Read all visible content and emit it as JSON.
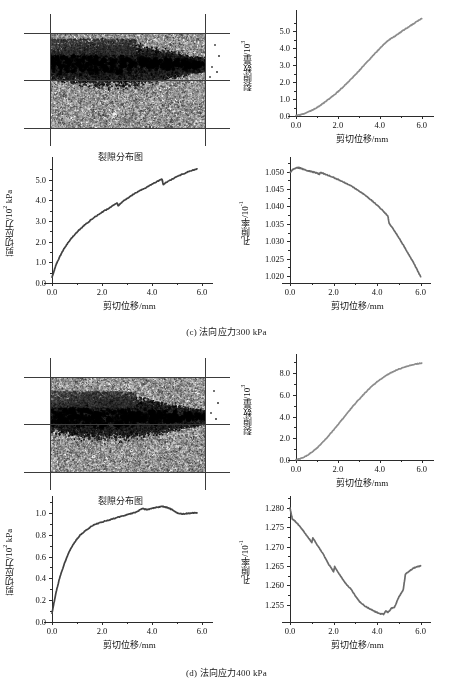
{
  "figure": {
    "panels": [
      {
        "id": "c",
        "caption": "(c) 法向应力300 kPa",
        "crack_image_label": "裂隙分布图"
      },
      {
        "id": "d",
        "caption": "(d) 法向应力400 kPa",
        "crack_image_label": "裂隙分布图"
      }
    ]
  },
  "chart_data": [
    {
      "id": "c-crack-number",
      "type": "line",
      "title": "",
      "xlabel": "剪切位移/mm",
      "ylabel": "裂隙数量/10³",
      "xlim": [
        0.0,
        6.3
      ],
      "ylim": [
        0.0,
        5.9
      ],
      "xticks": [
        0.0,
        2.0,
        4.0,
        6.0
      ],
      "xticklabels": [
        "0.0",
        "2.0",
        "4.0",
        "6.0"
      ],
      "yticks": [
        0.0,
        1.0,
        2.0,
        3.0,
        4.0,
        5.0
      ],
      "yticklabels": [
        "0.0",
        "1.0",
        "2.0",
        "3.0",
        "4.0",
        "5.0"
      ],
      "grid": false,
      "legend": "none",
      "color": "#8c8c8c",
      "x": [
        0.0,
        0.2,
        0.4,
        0.6,
        0.8,
        1.0,
        1.2,
        1.4,
        1.6,
        1.8,
        2.0,
        2.2,
        2.4,
        2.6,
        2.8,
        3.0,
        3.2,
        3.4,
        3.6,
        3.8,
        4.0,
        4.2,
        4.4,
        4.6,
        4.8,
        5.0,
        5.2,
        5.4,
        5.6,
        5.8,
        6.0
      ],
      "y": [
        0.02,
        0.07,
        0.14,
        0.24,
        0.36,
        0.5,
        0.66,
        0.84,
        1.03,
        1.22,
        1.43,
        1.66,
        1.9,
        2.14,
        2.4,
        2.66,
        2.93,
        3.2,
        3.47,
        3.73,
        3.99,
        4.24,
        4.46,
        4.62,
        4.78,
        4.95,
        5.12,
        5.28,
        5.44,
        5.6,
        5.75
      ]
    },
    {
      "id": "c-shear-stress",
      "type": "line",
      "title": "",
      "xlabel": "剪切位移/mm",
      "ylabel": "剪切应力/10² kPa",
      "xlim": [
        0.0,
        6.2
      ],
      "ylim": [
        0.0,
        5.8
      ],
      "xticks": [
        0.0,
        2.0,
        4.0,
        6.0
      ],
      "xticklabels": [
        "0.0",
        "2.0",
        "4.0",
        "6.0"
      ],
      "yticks": [
        0.0,
        1.0,
        2.0,
        3.0,
        4.0,
        5.0
      ],
      "yticklabels": [
        "0.0",
        "1.0",
        "2.0",
        "3.0",
        "4.0",
        "5.0"
      ],
      "grid": false,
      "legend": "none",
      "color": "#414141",
      "x": [
        0.0,
        0.05,
        0.15,
        0.3,
        0.5,
        0.7,
        0.9,
        1.1,
        1.4,
        1.7,
        2.0,
        2.3,
        2.6,
        2.65,
        2.75,
        3.0,
        3.3,
        3.6,
        3.9,
        4.2,
        4.4,
        4.45,
        4.6,
        4.9,
        5.2,
        5.5,
        5.8
      ],
      "y": [
        0.28,
        0.45,
        0.85,
        1.25,
        1.7,
        2.05,
        2.33,
        2.58,
        2.9,
        3.18,
        3.42,
        3.63,
        3.88,
        3.72,
        3.86,
        4.08,
        4.32,
        4.52,
        4.7,
        4.9,
        5.02,
        4.76,
        4.88,
        5.08,
        5.25,
        5.4,
        5.52
      ]
    },
    {
      "id": "c-porosity",
      "type": "line",
      "title": "",
      "xlabel": "剪切位移/mm",
      "ylabel": "孔隙率/10⁻¹",
      "xlim": [
        0.0,
        6.2
      ],
      "ylim": [
        1.018,
        1.0525
      ],
      "xticks": [
        0.0,
        2.0,
        4.0,
        6.0
      ],
      "xticklabels": [
        "0.0",
        "2.0",
        "4.0",
        "6.0"
      ],
      "yticks": [
        1.02,
        1.025,
        1.03,
        1.035,
        1.04,
        1.045,
        1.05
      ],
      "yticklabels": [
        "1.020",
        "1.025",
        "1.030",
        "1.035",
        "1.040",
        "1.045",
        "1.050"
      ],
      "grid": false,
      "legend": "none",
      "color": "#6b6b6b",
      "x": [
        0.0,
        0.15,
        0.3,
        0.45,
        0.6,
        0.8,
        1.0,
        1.2,
        1.35,
        1.4,
        1.6,
        1.9,
        2.2,
        2.5,
        2.8,
        3.1,
        3.4,
        3.7,
        4.0,
        4.3,
        4.5,
        4.55,
        4.8,
        5.1,
        5.4,
        5.7,
        6.0
      ],
      "y": [
        1.0498,
        1.0507,
        1.0512,
        1.0511,
        1.0507,
        1.0503,
        1.05,
        1.0497,
        1.0493,
        1.0498,
        1.0493,
        1.0486,
        1.0478,
        1.0469,
        1.0459,
        1.0448,
        1.0435,
        1.042,
        1.0404,
        1.0386,
        1.0372,
        1.0352,
        1.033,
        1.03,
        1.0268,
        1.0235,
        1.0198
      ]
    },
    {
      "id": "d-crack-number",
      "type": "line",
      "title": "",
      "xlabel": "剪切位移/mm",
      "ylabel": "裂隙数量/10³",
      "xlim": [
        0.0,
        6.3
      ],
      "ylim": [
        0.0,
        9.2
      ],
      "xticks": [
        0.0,
        2.0,
        4.0,
        6.0
      ],
      "xticklabels": [
        "0.0",
        "2.0",
        "4.0",
        "6.0"
      ],
      "yticks": [
        0.0,
        2.0,
        4.0,
        6.0,
        8.0
      ],
      "yticklabels": [
        "0.0",
        "2.0",
        "4.0",
        "6.0",
        "8.0"
      ],
      "grid": false,
      "legend": "none",
      "color": "#8c8c8c",
      "x": [
        0.0,
        0.2,
        0.4,
        0.6,
        0.8,
        1.0,
        1.2,
        1.5,
        1.8,
        2.1,
        2.4,
        2.7,
        3.0,
        3.3,
        3.6,
        3.9,
        4.2,
        4.5,
        4.8,
        5.1,
        5.4,
        5.7,
        6.0
      ],
      "y": [
        0.03,
        0.12,
        0.28,
        0.5,
        0.78,
        1.1,
        1.48,
        2.1,
        2.78,
        3.48,
        4.2,
        4.9,
        5.56,
        6.18,
        6.75,
        7.24,
        7.66,
        8.0,
        8.28,
        8.5,
        8.68,
        8.82,
        8.92
      ]
    },
    {
      "id": "d-shear-stress",
      "type": "line",
      "title": "",
      "xlabel": "剪切位移/mm",
      "ylabel": "剪切应力/10² kPa",
      "xlim": [
        0.0,
        6.2
      ],
      "ylim": [
        0.0,
        1.1
      ],
      "xticks": [
        0.0,
        2.0,
        4.0,
        6.0
      ],
      "xticklabels": [
        "0.0",
        "2.0",
        "4.0",
        "6.0"
      ],
      "yticks": [
        0.0,
        0.2,
        0.4,
        0.6,
        0.8,
        1.0
      ],
      "yticklabels": [
        "0.0",
        "0.2",
        "0.4",
        "0.6",
        "0.8",
        "1.0"
      ],
      "grid": false,
      "legend": "none",
      "color": "#414141",
      "x": [
        0.0,
        0.05,
        0.15,
        0.3,
        0.5,
        0.7,
        0.9,
        1.1,
        1.3,
        1.6,
        1.9,
        2.2,
        2.5,
        2.8,
        3.1,
        3.4,
        3.6,
        3.8,
        4.0,
        4.2,
        4.4,
        4.6,
        4.8,
        5.0,
        5.2,
        5.4,
        5.6,
        5.8
      ],
      "y": [
        0.08,
        0.14,
        0.26,
        0.4,
        0.54,
        0.65,
        0.73,
        0.79,
        0.83,
        0.88,
        0.91,
        0.93,
        0.95,
        0.97,
        0.99,
        1.01,
        1.04,
        1.03,
        1.04,
        1.05,
        1.06,
        1.05,
        1.03,
        1.0,
        0.99,
        0.995,
        1.0,
        1.0
      ]
    },
    {
      "id": "d-porosity",
      "type": "line",
      "title": "",
      "xlabel": "剪切位移/mm",
      "ylabel": "孔隙率/10⁻¹",
      "xlim": [
        0.0,
        6.2
      ],
      "ylim": [
        1.2505,
        1.2815
      ],
      "xticks": [
        0.0,
        2.0,
        4.0,
        6.0
      ],
      "xticklabels": [
        "0.0",
        "2.0",
        "4.0",
        "6.0"
      ],
      "yticks": [
        1.255,
        1.26,
        1.265,
        1.27,
        1.275,
        1.28
      ],
      "yticklabels": [
        "1.255",
        "1.260",
        "1.265",
        "1.270",
        "1.275",
        "1.280"
      ],
      "grid": false,
      "legend": "none",
      "color": "#6b6b6b",
      "x": [
        0.0,
        0.1,
        0.3,
        0.55,
        0.8,
        1.0,
        1.05,
        1.3,
        1.55,
        1.8,
        2.0,
        2.05,
        2.3,
        2.55,
        2.8,
        3.0,
        3.2,
        3.45,
        3.7,
        3.9,
        4.1,
        4.3,
        4.4,
        4.5,
        4.65,
        4.8,
        5.0,
        5.2,
        5.3,
        5.5,
        5.7,
        5.85,
        6.0
      ],
      "y": [
        1.28,
        1.2772,
        1.2762,
        1.2745,
        1.2726,
        1.271,
        1.2722,
        1.27,
        1.2678,
        1.2652,
        1.2635,
        1.2648,
        1.2625,
        1.2605,
        1.259,
        1.2572,
        1.2558,
        1.2546,
        1.2538,
        1.2532,
        1.2527,
        1.2525,
        1.2533,
        1.253,
        1.254,
        1.2543,
        1.257,
        1.2588,
        1.2628,
        1.2638,
        1.2645,
        1.2648,
        1.265
      ]
    }
  ]
}
